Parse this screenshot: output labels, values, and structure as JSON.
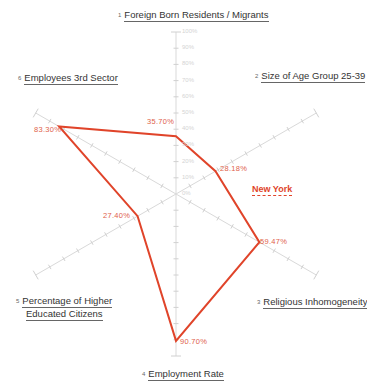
{
  "chart_data": {
    "type": "radar",
    "title": "",
    "axes": [
      {
        "index": "1",
        "label": "Foreign Born Residents / Migrants"
      },
      {
        "index": "2",
        "label": "Size of Age Group 25-39"
      },
      {
        "index": "3",
        "label": "Religious Inhomogeneity"
      },
      {
        "index": "4",
        "label": "Employment Rate"
      },
      {
        "index": "5",
        "label": "Percentage of Higher Educated Citizens"
      },
      {
        "index": "6",
        "label": "Employees 3rd Sector"
      }
    ],
    "scale_ticks": [
      "0%",
      "10%",
      "20%",
      "30%",
      "40%",
      "50%",
      "60%",
      "70%",
      "80%",
      "90%",
      "100%"
    ],
    "range": [
      0,
      100
    ],
    "series": [
      {
        "name": "New York",
        "color": "#e0442a",
        "values": [
          35.7,
          28.18,
          59.47,
          90.7,
          27.4,
          83.3
        ],
        "value_labels": [
          "35.70%",
          "28.18%",
          "59.47%",
          "90.70%",
          "27.40%",
          "83.30%"
        ]
      }
    ]
  },
  "labels": {
    "axis1_num": "1",
    "axis1": "Foreign Born Residents / Migrants",
    "axis2_num": "2",
    "axis2": "Size of Age Group 25-39",
    "axis3_num": "3",
    "axis3": "Religious Inhomogeneity",
    "axis4_num": "4",
    "axis4": "Employment Rate",
    "axis5_num": "5",
    "axis5_line1": "Percentage of Higher",
    "axis5_line2": "Educated Citizens",
    "axis6_num": "6",
    "axis6": "Employees 3rd Sector",
    "series_name": "New York",
    "v1": "35.70%",
    "v2": "28.18%",
    "v3": "59.47%",
    "v4": "90.70%",
    "v5": "27.40%",
    "v6": "83.30%",
    "ticks": [
      "0%",
      "10%",
      "20%",
      "30%",
      "40%",
      "50%",
      "60%",
      "70%",
      "80%",
      "90%",
      "100%"
    ]
  }
}
